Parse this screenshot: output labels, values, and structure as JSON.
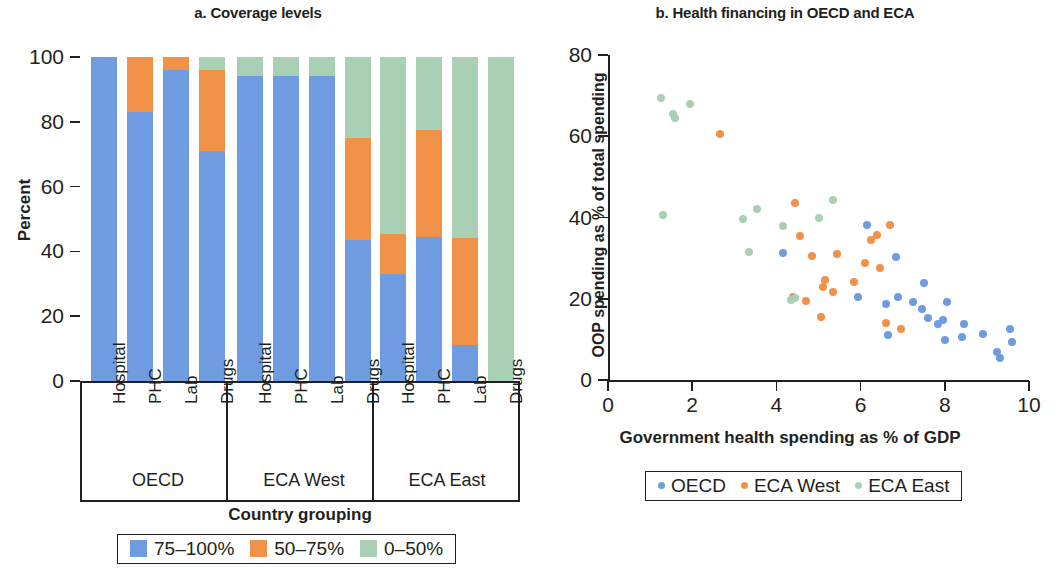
{
  "panel_a": {
    "title": "a. Coverage levels",
    "y_axis_title": "Percent",
    "x_axis_title": "Country grouping",
    "y_ticks": [
      0,
      20,
      40,
      60,
      80,
      100
    ],
    "groups": [
      "OECD",
      "ECA West",
      "ECA East"
    ],
    "categories": [
      "Hospital",
      "PHC",
      "Lab",
      "Drugs"
    ],
    "legend": [
      {
        "label": "75–100%",
        "color": "#6f9ce0"
      },
      {
        "label": "50–75%",
        "color": "#f0924a"
      },
      {
        "label": "0–50%",
        "color": "#a9cfb4"
      }
    ]
  },
  "panel_b": {
    "title": "b. Health financing in OECD and ECA",
    "y_axis_title": "OOP spending as % of total spending",
    "x_axis_title": "Government health spending as % of GDP",
    "y_ticks": [
      0,
      20,
      40,
      60,
      80
    ],
    "x_ticks": [
      0,
      2,
      4,
      6,
      8,
      10
    ],
    "legend": [
      {
        "label": "OECD",
        "color": "#6f9ce0"
      },
      {
        "label": "ECA West",
        "color": "#f0924a"
      },
      {
        "label": "ECA East",
        "color": "#a9cfb4"
      }
    ]
  },
  "chart_data": [
    {
      "type": "bar",
      "subtype": "stacked-100",
      "title": "a. Coverage levels",
      "xlabel": "Country grouping",
      "ylabel": "Percent",
      "ylim": [
        0,
        100
      ],
      "yticks": [
        0,
        20,
        40,
        60,
        80,
        100
      ],
      "grid": false,
      "legend_position": "bottom",
      "categories": [
        "OECD / Hospital",
        "OECD / PHC",
        "OECD / Lab",
        "OECD / Drugs",
        "ECA West / Hospital",
        "ECA West / PHC",
        "ECA West / Lab",
        "ECA West / Drugs",
        "ECA East / Hospital",
        "ECA East / PHC",
        "ECA East / Lab",
        "ECA East / Drugs"
      ],
      "series": [
        {
          "name": "75–100%",
          "color": "#6f9ce0",
          "values": [
            100,
            83,
            96,
            71,
            94,
            94,
            94,
            43.5,
            33,
            44.5,
            11,
            0
          ]
        },
        {
          "name": "50–75%",
          "color": "#f0924a",
          "values": [
            0,
            17,
            4,
            25,
            0,
            0,
            0,
            31.5,
            12.5,
            33,
            33,
            0
          ]
        },
        {
          "name": "0–50%",
          "color": "#a9cfb4",
          "values": [
            0,
            0,
            0,
            4,
            6,
            6,
            6,
            25,
            54.5,
            22.5,
            56,
            100
          ]
        }
      ]
    },
    {
      "type": "scatter",
      "title": "b. Health financing in OECD and ECA",
      "xlabel": "Government health spending as % of GDP",
      "ylabel": "OOP spending as % of total spending",
      "xlim": [
        0,
        10
      ],
      "ylim": [
        0,
        80
      ],
      "xticks": [
        0,
        2,
        4,
        6,
        8,
        10
      ],
      "yticks": [
        0,
        20,
        40,
        60,
        80
      ],
      "grid": false,
      "legend_position": "bottom",
      "series": [
        {
          "name": "OECD",
          "color": "#6f9ce0",
          "points": [
            [
              4.15,
              31.3
            ],
            [
              5.95,
              20.4
            ],
            [
              6.15,
              38.1
            ],
            [
              6.6,
              18.7
            ],
            [
              6.65,
              11.1
            ],
            [
              6.85,
              30.3
            ],
            [
              6.9,
              20.4
            ],
            [
              7.25,
              19.3
            ],
            [
              7.45,
              17.6
            ],
            [
              7.5,
              24.0
            ],
            [
              7.6,
              15.2
            ],
            [
              7.85,
              13.7
            ],
            [
              7.95,
              14.7
            ],
            [
              8.0,
              9.9
            ],
            [
              8.05,
              19.2
            ],
            [
              8.4,
              10.6
            ],
            [
              8.45,
              13.9
            ],
            [
              8.9,
              11.3
            ],
            [
              9.25,
              6.8
            ],
            [
              9.3,
              5.3
            ],
            [
              9.55,
              12.6
            ],
            [
              9.6,
              9.3
            ]
          ]
        },
        {
          "name": "ECA West",
          "color": "#f0924a",
          "points": [
            [
              2.65,
              60.6
            ],
            [
              4.4,
              20.4
            ],
            [
              4.45,
              43.6
            ],
            [
              4.55,
              35.4
            ],
            [
              4.7,
              19.5
            ],
            [
              4.85,
              30.5
            ],
            [
              5.05,
              15.5
            ],
            [
              5.1,
              22.8
            ],
            [
              5.15,
              24.5
            ],
            [
              5.35,
              21.6
            ],
            [
              5.45,
              30.9
            ],
            [
              5.85,
              24.1
            ],
            [
              6.1,
              28.9
            ],
            [
              6.25,
              34.5
            ],
            [
              6.4,
              35.7
            ],
            [
              6.45,
              27.5
            ],
            [
              6.6,
              14.0
            ],
            [
              6.7,
              38.2
            ],
            [
              6.95,
              12.5
            ]
          ]
        },
        {
          "name": "ECA East",
          "color": "#a9cfb4",
          "points": [
            [
              1.25,
              69.3
            ],
            [
              1.55,
              65.5
            ],
            [
              1.6,
              64.4
            ],
            [
              1.95,
              68.0
            ],
            [
              1.3,
              40.5
            ],
            [
              3.2,
              39.7
            ],
            [
              3.35,
              31.5
            ],
            [
              3.55,
              42.2
            ],
            [
              4.15,
              37.8
            ],
            [
              4.45,
              20.3
            ],
            [
              5.0,
              39.9
            ],
            [
              5.35,
              44.2
            ],
            [
              4.35,
              19.8
            ]
          ]
        }
      ]
    }
  ]
}
